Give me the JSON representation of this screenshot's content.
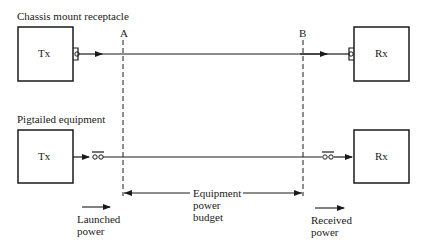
{
  "diagram": {
    "top_section": {
      "title": "Chassis mount receptacle",
      "transmitter_label": "Tx",
      "receiver_label": "Rx"
    },
    "bottom_section": {
      "title": "Pigtailed equipment",
      "transmitter_label": "Tx",
      "receiver_label": "Rx"
    },
    "reference_points": {
      "a": "A",
      "b": "B"
    },
    "budget_label": {
      "line1": "Equipment",
      "line2": "power",
      "line3": "budget"
    },
    "launched_label": {
      "line1": "Launched",
      "line2": "power"
    },
    "received_label": {
      "line1": "Received",
      "line2": "power"
    },
    "colors": {
      "stroke": "#1a1a1a",
      "background": "#ffffff"
    }
  }
}
